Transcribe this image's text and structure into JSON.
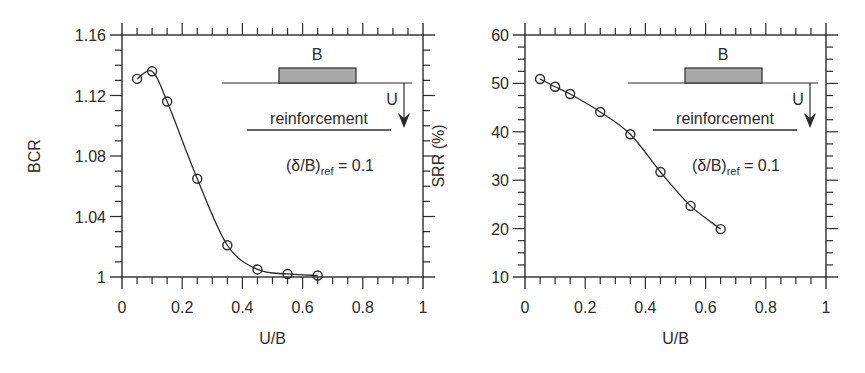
{
  "chart_data": [
    {
      "type": "line",
      "title": "",
      "xlabel": "U/B",
      "ylabel": "BCR",
      "xlim": [
        0,
        1
      ],
      "ylim": [
        1.0,
        1.16
      ],
      "x_ticks": [
        "0",
        "0.2",
        "0.4",
        "0.6",
        "0.8",
        "1"
      ],
      "y_ticks": [
        "1",
        "1.04",
        "1.08",
        "1.12",
        "1.16"
      ],
      "grid": false,
      "legend": null,
      "x": [
        0.05,
        0.1,
        0.15,
        0.25,
        0.35,
        0.45,
        0.55,
        0.65
      ],
      "series": [
        {
          "name": "BCR",
          "values": [
            1.131,
            1.136,
            1.116,
            1.065,
            1.021,
            1.005,
            1.002,
            1.001
          ],
          "marker": "open-circle",
          "smooth": true
        }
      ],
      "annotations": {
        "footing_label": "B",
        "depth_label": "U",
        "layer_label": "reinforcement",
        "condition_prefix": "(δ/B)",
        "condition_subscript": "ref",
        "condition_suffix": " = 0.1"
      }
    },
    {
      "type": "line",
      "title": "",
      "xlabel": "U/B",
      "ylabel": "SRR (%)",
      "xlim": [
        0,
        1
      ],
      "ylim": [
        10,
        60
      ],
      "x_ticks": [
        "0",
        "0.2",
        "0.4",
        "0.6",
        "0.8",
        "1"
      ],
      "y_ticks": [
        "10",
        "20",
        "30",
        "40",
        "50",
        "60"
      ],
      "grid": false,
      "legend": null,
      "x": [
        0.05,
        0.1,
        0.15,
        0.25,
        0.35,
        0.45,
        0.55,
        0.65
      ],
      "series": [
        {
          "name": "SRR",
          "values": [
            50.9,
            49.3,
            47.8,
            44.1,
            39.5,
            31.7,
            24.7,
            19.9
          ],
          "marker": "open-circle",
          "smooth": true
        }
      ],
      "annotations": {
        "footing_label": "B",
        "depth_label": "U",
        "layer_label": "reinforcement",
        "condition_prefix": "(δ/B)",
        "condition_subscript": "ref",
        "condition_suffix": " = 0.1"
      }
    }
  ],
  "colors": {
    "ink": "#2b2b2b",
    "footing_fill": "#a9a9a9"
  }
}
